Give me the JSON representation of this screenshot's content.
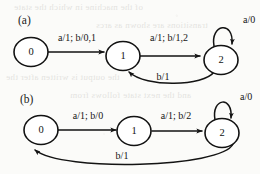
{
  "figure": {
    "background_color": "#fbfbf9",
    "ink_color": "#131313",
    "panels": [
      {
        "tag": "(a)",
        "states": [
          {
            "id": "a-s0",
            "label": "0"
          },
          {
            "id": "a-s1",
            "label": "1"
          },
          {
            "id": "a-s2",
            "label": "2"
          }
        ],
        "transitions": [
          {
            "id": "a-t0",
            "from": "0",
            "to": "1",
            "label": "a/1; b/0,1",
            "shape": "straight"
          },
          {
            "id": "a-t1",
            "from": "1",
            "to": "2",
            "label": "a/1; b/1,2",
            "shape": "straight"
          },
          {
            "id": "a-t2",
            "from": "2",
            "to": "2",
            "label": "a/0",
            "shape": "self-loop"
          },
          {
            "id": "a-t3",
            "from": "2",
            "to": "1",
            "label": "b/1",
            "shape": "curve-below"
          }
        ]
      },
      {
        "tag": "(b)",
        "states": [
          {
            "id": "b-s0",
            "label": "0"
          },
          {
            "id": "b-s1",
            "label": "1"
          },
          {
            "id": "b-s2",
            "label": "2"
          }
        ],
        "transitions": [
          {
            "id": "b-t0",
            "from": "0",
            "to": "1",
            "label": "a/1; b/0",
            "shape": "straight"
          },
          {
            "id": "b-t1",
            "from": "1",
            "to": "2",
            "label": "a/1; b/2",
            "shape": "straight"
          },
          {
            "id": "b-t2",
            "from": "2",
            "to": "2",
            "label": "a/0",
            "shape": "self-loop"
          },
          {
            "id": "b-t3",
            "from": "2",
            "to": "0",
            "label": "b/1",
            "shape": "curve-below-long"
          }
        ]
      }
    ],
    "scan_bleed": [
      "of the machine in which the state",
      "transitions are shown as arcs",
      "the output is written after the",
      "and the next state follows from"
    ]
  }
}
